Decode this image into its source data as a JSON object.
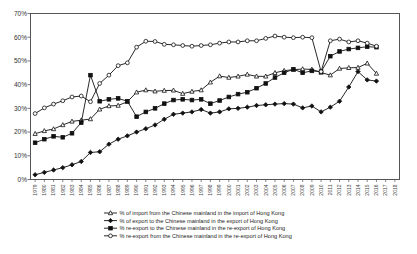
{
  "chart_data": {
    "type": "line",
    "title": "",
    "xlabel": "",
    "ylabel": "",
    "ylim": [
      0,
      70
    ],
    "ytick_labels": [
      "0%",
      "10%",
      "20%",
      "30%",
      "40%",
      "50%",
      "60%",
      "70%"
    ],
    "ytick_values": [
      0,
      10,
      20,
      30,
      40,
      50,
      60,
      70
    ],
    "grid": false,
    "legend_position": "bottom",
    "x": [
      1979,
      1980,
      1981,
      1982,
      1983,
      1984,
      1985,
      1986,
      1987,
      1988,
      1989,
      1990,
      1991,
      1992,
      1993,
      1994,
      1995,
      1996,
      1997,
      1998,
      1999,
      2000,
      2001,
      2002,
      2003,
      2004,
      2005,
      2006,
      2007,
      2008,
      2009,
      2010,
      2011,
      2012,
      2013,
      2014,
      2015,
      2016,
      2017,
      2018
    ],
    "categories": [
      "1979",
      "1980",
      "1981",
      "1982",
      "1983",
      "1984",
      "1985",
      "1986",
      "1987",
      "1988",
      "1989",
      "1990",
      "1991",
      "1992",
      "1993",
      "1994",
      "1995",
      "1996",
      "1997",
      "1998",
      "1999",
      "2000",
      "2001",
      "2002",
      "2003",
      "2004",
      "2005",
      "2006",
      "2007",
      "2008",
      "2009",
      "2010",
      "2011",
      "2012",
      "2013",
      "2014",
      "2015",
      "2016",
      "2017",
      "2018"
    ],
    "series": [
      {
        "name": "% of import from the Chinese mainland in the import of Hong Kong",
        "marker": "open-triangle",
        "values": [
          19.3,
          20.5,
          21.3,
          23.0,
          24.5,
          25.0,
          25.5,
          29.6,
          31.0,
          31.2,
          32.8,
          36.8,
          37.7,
          37.2,
          37.5,
          37.6,
          36.2,
          37.1,
          37.7,
          41.0,
          43.6,
          43.0,
          43.5,
          44.3,
          43.5,
          43.5,
          45.0,
          45.9,
          46.3,
          46.6,
          46.4,
          45.1,
          44.0,
          46.8,
          47.1,
          47.2,
          49.0,
          44.7,
          null,
          null
        ]
      },
      {
        "name": "% of export to the Chinese mainland in the export of Hong Kong",
        "marker": "filled-diamond",
        "values": [
          2.0,
          3.0,
          4.0,
          5.0,
          6.2,
          7.6,
          11.4,
          11.7,
          14.9,
          17.0,
          18.4,
          20.0,
          21.4,
          23.0,
          25.4,
          27.5,
          28.0,
          28.5,
          29.5,
          28.0,
          28.5,
          29.8,
          30.0,
          30.5,
          31.2,
          31.5,
          31.8,
          32.0,
          31.8,
          30.2,
          31.0,
          28.5,
          30.5,
          33.0,
          39.0,
          45.5,
          42.0,
          41.5,
          null,
          null
        ]
      },
      {
        "name": "% of re-export to the Chinese mainland in the re-export of Hong Kong",
        "marker": "filled-square",
        "values": [
          15.5,
          17.0,
          18.2,
          17.8,
          19.5,
          24.0,
          44.0,
          33.0,
          33.8,
          34.2,
          33.0,
          26.5,
          28.5,
          30.0,
          32.0,
          33.5,
          33.8,
          33.5,
          33.8,
          32.0,
          33.3,
          34.8,
          36.0,
          36.8,
          38.5,
          40.5,
          43.0,
          45.0,
          46.5,
          45.0,
          45.8,
          45.5,
          52.0,
          54.0,
          55.0,
          55.5,
          56.0,
          55.8,
          null,
          null
        ]
      },
      {
        "name": "% re-export from the Chinese mainland in the re-export of Hong Kong",
        "marker": "open-circle",
        "values": [
          27.8,
          30.2,
          31.8,
          33.2,
          34.8,
          35.2,
          32.8,
          40.5,
          44.0,
          48.0,
          49.2,
          55.8,
          58.3,
          58.2,
          57.0,
          56.8,
          56.5,
          56.2,
          56.5,
          56.8,
          57.5,
          58.0,
          58.0,
          58.5,
          58.5,
          59.5,
          60.5,
          60.0,
          59.8,
          60.0,
          59.8,
          45.5,
          58.5,
          59.2,
          58.0,
          58.5,
          57.5,
          56.2,
          null,
          null
        ]
      }
    ]
  },
  "legend": {
    "items": [
      {
        "label": "% of import from the Chinese mainland in the import of Hong Kong",
        "marker": "open-triangle"
      },
      {
        "label": "% of export to the Chinese mainland in the export of Hong Kong",
        "marker": "filled-diamond"
      },
      {
        "label": "% re-export to the Chinese mainland in the re-export of Hong Kong",
        "marker": "filled-square"
      },
      {
        "label": "% re-export from the Chinese mainland in the re-export of Hong Kong",
        "marker": "open-circle"
      }
    ]
  }
}
